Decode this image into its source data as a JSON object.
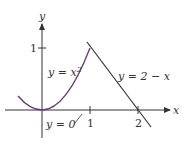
{
  "figure": {
    "axes": {
      "x_label": "x",
      "y_label": "y",
      "x_ticks": [
        "1",
        "2"
      ],
      "y_ticks": [
        "1"
      ]
    },
    "curves": [
      {
        "name": "parabola",
        "label": "y = x²",
        "label_base": "y = x",
        "label_sup": "2"
      },
      {
        "name": "line",
        "label": "y = 2 − x"
      },
      {
        "name": "x-axis",
        "label": "y = 0"
      }
    ],
    "colors": {
      "curve": "#6a3f78",
      "line": "#333333",
      "axis": "#333333"
    }
  }
}
